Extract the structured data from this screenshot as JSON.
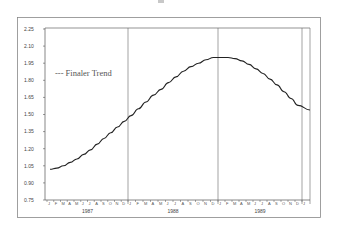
{
  "chart_data": {
    "type": "line",
    "title": "",
    "xlabel": "",
    "ylabel": "",
    "ylim": [
      0.75,
      2.25
    ],
    "yticks": [
      "2.25",
      "2.10",
      "1.95",
      "1.80",
      "1.65",
      "1.50",
      "1.35",
      "1.20",
      "1.05",
      "0.90",
      "0.75"
    ],
    "year_labels": [
      "1987",
      "1988",
      "1989"
    ],
    "month_ticks": [
      "J",
      "F",
      "M",
      "A",
      "M",
      "J",
      "J",
      "A",
      "S",
      "O",
      "N",
      "D"
    ],
    "grid": false,
    "legend": {
      "position": "upper-left",
      "entries": [
        "--- Finaler Trend"
      ]
    },
    "series": [
      {
        "name": "Finaler Trend",
        "x": [
          "1987-01",
          "1987-02",
          "1987-03",
          "1987-04",
          "1987-05",
          "1987-06",
          "1987-07",
          "1987-08",
          "1987-09",
          "1987-10",
          "1987-11",
          "1987-12",
          "1988-01",
          "1988-02",
          "1988-03",
          "1988-04",
          "1988-05",
          "1988-06",
          "1988-07",
          "1988-08",
          "1988-09",
          "1988-10",
          "1988-11",
          "1988-12",
          "1989-01",
          "1989-02",
          "1989-03",
          "1989-04",
          "1989-05",
          "1989-06",
          "1989-07",
          "1989-08",
          "1989-09",
          "1989-10",
          "1989-11",
          "1989-12",
          "1990-01"
        ],
        "values": [
          1.02,
          1.03,
          1.05,
          1.08,
          1.11,
          1.15,
          1.19,
          1.24,
          1.29,
          1.34,
          1.39,
          1.44,
          1.49,
          1.55,
          1.61,
          1.67,
          1.72,
          1.78,
          1.83,
          1.88,
          1.92,
          1.95,
          1.98,
          2.0,
          2.0,
          2.0,
          1.99,
          1.97,
          1.94,
          1.9,
          1.86,
          1.81,
          1.76,
          1.7,
          1.64,
          1.58,
          1.54
        ]
      }
    ]
  },
  "legend_label": "--- Finaler Trend",
  "colors": {
    "line": "#222222",
    "frame": "#777777",
    "axis": "#555555"
  }
}
